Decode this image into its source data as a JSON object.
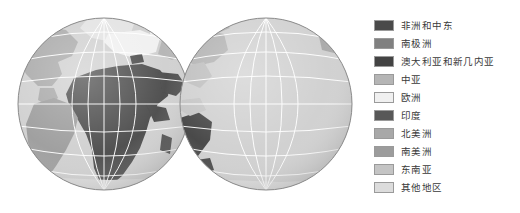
{
  "figure": {
    "type": "world-map-two-globes",
    "background_color": "#ffffff"
  },
  "map": {
    "projection": "orthographic",
    "graticule_color": "#ffffff",
    "graticule_spacing_degrees": 30,
    "ocean_color": "#cfcfcf",
    "outline_color": "#8a8a8a",
    "globes": [
      {
        "name": "globe-atlantic",
        "center_longitude": -10,
        "center_latitude": 10,
        "visible_regions": [
          "非洲和中东",
          "南美洲",
          "欧洲",
          "北美洲",
          "其他地区"
        ]
      },
      {
        "name": "globe-pacific",
        "center_longitude": 170,
        "center_latitude": 10,
        "visible_regions": [
          "东南亚",
          "澳大利亚和新几内亚",
          "北美洲",
          "其他地区"
        ]
      }
    ]
  },
  "legend": {
    "items": [
      {
        "label": "非洲和中东",
        "color": "#4a4a4a"
      },
      {
        "label": "南极洲",
        "color": "#808080"
      },
      {
        "label": "澳大利亚和新几内亚",
        "color": "#434343"
      },
      {
        "label": "中亚",
        "color": "#b5b5b5"
      },
      {
        "label": "欧洲",
        "color": "#f0f0f0"
      },
      {
        "label": "印度",
        "color": "#585858"
      },
      {
        "label": "北美洲",
        "color": "#a8a8a8"
      },
      {
        "label": "南美洲",
        "color": "#9c9c9c"
      },
      {
        "label": "东南亚",
        "color": "#c4c4c4"
      },
      {
        "label": "其他地区",
        "color": "#dcdcdc"
      }
    ]
  }
}
